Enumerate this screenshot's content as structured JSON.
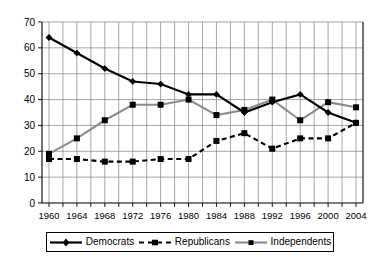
{
  "chart_data": {
    "type": "line",
    "title": "",
    "subtitle": "",
    "xlabel": "",
    "ylabel": "",
    "categories": [
      "1960",
      "1964",
      "1968",
      "1972",
      "1976",
      "1980",
      "1984",
      "1988",
      "1992",
      "1996",
      "2000",
      "2004"
    ],
    "x": [
      1960,
      1964,
      1968,
      1972,
      1976,
      1980,
      1984,
      1988,
      1992,
      1996,
      2000,
      2004
    ],
    "xlim": [
      1959,
      2005
    ],
    "ylim": [
      0,
      70
    ],
    "ytick_labels": [
      "0",
      "10",
      "20",
      "30",
      "40",
      "50",
      "60",
      "70"
    ],
    "yticks": [
      0,
      10,
      20,
      30,
      40,
      50,
      60,
      70
    ],
    "xtick_labels": [
      "1960",
      "1964",
      "1968",
      "1972",
      "1976",
      "1980",
      "1984",
      "1988",
      "1992",
      "1996",
      "2000",
      "2004"
    ],
    "grid": true,
    "legend_position": "bottom",
    "series": [
      {
        "name": "Democrats",
        "color": "#000000",
        "style": "solid",
        "marker": "diamond",
        "values": [
          64,
          58,
          52,
          47,
          46,
          42,
          42,
          35,
          39,
          42,
          35,
          31
        ]
      },
      {
        "name": "Republicans",
        "color": "#000000",
        "style": "dashed",
        "marker": "square",
        "values": [
          17,
          17,
          16,
          16,
          17,
          17,
          24,
          27,
          21,
          25,
          25,
          31
        ]
      },
      {
        "name": "Independents",
        "color": "#8c8c8c",
        "style": "solid",
        "marker": "square",
        "values": [
          19,
          25,
          32,
          38,
          38,
          40,
          34,
          36,
          40,
          32,
          39,
          37
        ]
      }
    ]
  },
  "legend": {
    "items": [
      {
        "label": "Democrats"
      },
      {
        "label": "Republicans"
      },
      {
        "label": "Independents"
      }
    ]
  }
}
